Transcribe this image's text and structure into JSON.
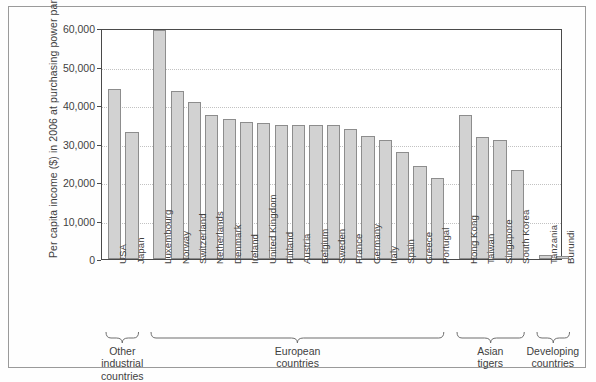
{
  "chart_data": {
    "type": "bar",
    "title": "",
    "xlabel": "",
    "ylabel": "Per capita income ($) in 2006 at purchasing power parity",
    "ylim": [
      0,
      60000
    ],
    "ytick_labels": [
      "0",
      "10,000",
      "20,000",
      "30,000",
      "40,000",
      "50,000",
      "60,000"
    ],
    "ytick_values": [
      0,
      10000,
      20000,
      30000,
      40000,
      50000,
      60000
    ],
    "grid": true,
    "legend": "none",
    "bar_color": "#d2d2d2",
    "bar_border_color": "#8d8d8d",
    "categories": [
      "USA",
      "Japan",
      "Luxembourg",
      "Norway",
      "Switzerland",
      "Netherlands",
      "Denmark",
      "Ireland",
      "United Kingdom",
      "Finland",
      "Austria",
      "Belgium",
      "Sweden",
      "France",
      "Germany",
      "Italy",
      "Spain",
      "Greece",
      "Portugal",
      "Hong Kong",
      "Taiwan",
      "Singapore",
      "South Korea",
      "Tanzania",
      "Burundi"
    ],
    "values": [
      44200,
      33100,
      59400,
      43700,
      40800,
      37500,
      36300,
      35700,
      35300,
      34900,
      34900,
      34700,
      34700,
      33700,
      32000,
      31000,
      27800,
      24100,
      21000,
      37500,
      31700,
      31000,
      23100,
      1000,
      900
    ],
    "groups": [
      {
        "label": "Other\nindustrial\ncountries",
        "start": 0,
        "end": 1
      },
      {
        "label": "European\ncountries",
        "start": 2,
        "end": 18
      },
      {
        "label": "Asian\ntigers",
        "start": 19,
        "end": 22
      },
      {
        "label": "Developing\ncountries",
        "start": 23,
        "end": 24
      }
    ]
  }
}
